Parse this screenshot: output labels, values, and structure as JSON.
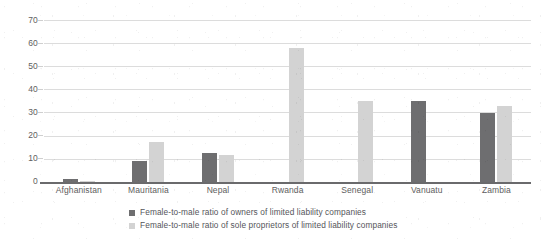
{
  "chart_data": {
    "type": "bar",
    "title": "",
    "xlabel": "",
    "ylabel": "",
    "ylim": [
      0,
      70
    ],
    "yticks": [
      0,
      10,
      20,
      30,
      40,
      50,
      60,
      70
    ],
    "grid": true,
    "legend_position": "bottom",
    "categories": [
      "Afghanistan",
      "Mauritania",
      "Nepal",
      "Rwanda",
      "Senegal",
      "Vanuatu",
      "Zambia"
    ],
    "series": [
      {
        "name": "Female-to-male ratio of owners of limited liability companies",
        "color": "#6e6e70",
        "values": [
          1.2,
          9,
          12.5,
          0,
          0,
          35,
          30
        ]
      },
      {
        "name": "Female-to-male ratio of sole proprietors of limited liability companies",
        "color": "#d3d3d3",
        "values": [
          0.3,
          17.5,
          11.5,
          58,
          35,
          0,
          33
        ]
      }
    ]
  },
  "axis": {
    "y_tick_labels": [
      "70",
      "60",
      "50",
      "40",
      "30",
      "20",
      "10",
      "0"
    ]
  },
  "legend": {
    "items": [
      {
        "label": "Female-to-male ratio of owners of limited liability companies",
        "swatch": "dark"
      },
      {
        "label": "Female-to-male ratio of sole proprietors of limited liability companies",
        "swatch": "light"
      }
    ]
  }
}
